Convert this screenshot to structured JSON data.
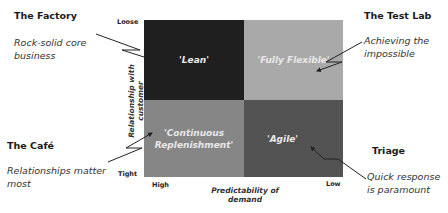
{
  "matrix": {
    "quadrants": [
      {
        "id": "top-left",
        "label": "'Lean'",
        "color": "#1f1f1f"
      },
      {
        "id": "top-right",
        "label": "'Fully Flexible'",
        "color": "#a9a9a9"
      },
      {
        "id": "bottom-left",
        "label": "'Continuous Replenishment'",
        "color": "#868686"
      },
      {
        "id": "bottom-right",
        "label": "'Agile'",
        "color": "#535353"
      }
    ],
    "y_axis": {
      "label": "Relationship with customer",
      "top": "Loose",
      "bottom": "Tight"
    },
    "x_axis": {
      "label": "Predictability of demand",
      "left": "High",
      "right": "Low"
    }
  },
  "callouts": [
    {
      "id": "factory",
      "title": "The Factory",
      "desc": "Rock-solid core business"
    },
    {
      "id": "test-lab",
      "title": "The Test Lab",
      "desc": "Achieving the impossible"
    },
    {
      "id": "cafe",
      "title": "The Café",
      "desc": "Relationships matter most"
    },
    {
      "id": "triage",
      "title": "Triage",
      "desc": "Quick response is paramount"
    }
  ]
}
